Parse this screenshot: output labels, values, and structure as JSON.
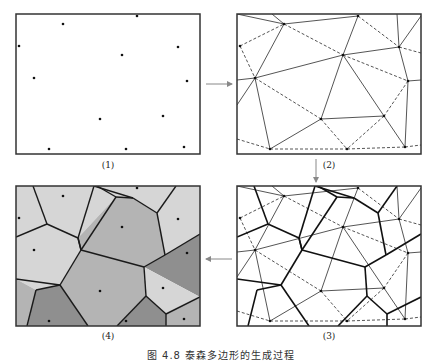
{
  "figure": {
    "caption": "图 4.8   泰森多边形的生成过程",
    "panel_size": [
      184,
      140
    ],
    "colors": {
      "frame": "#333333",
      "line": "#2a2a2a",
      "point": "#111111",
      "arrow": "#888888",
      "cell_light": "#d6d6d6",
      "cell_mid": "#b4b4b4",
      "cell_dark": "#8f8f8f"
    },
    "points": [
      [
        47,
        10
      ],
      [
        121,
        2
      ],
      [
        3,
        32
      ],
      [
        106,
        41
      ],
      [
        162,
        33
      ],
      [
        18,
        64
      ],
      [
        171,
        67
      ],
      [
        84,
        105
      ],
      [
        147,
        102
      ],
      [
        33,
        135
      ],
      [
        110,
        135
      ],
      [
        168,
        133
      ]
    ],
    "delaunay_solid": [
      [
        [
          0,
          0
        ],
        [
          47,
          10
        ]
      ],
      [
        [
          47,
          10
        ],
        [
          121,
          2
        ]
      ],
      [
        [
          47,
          10
        ],
        [
          18,
          64
        ]
      ],
      [
        [
          121,
          2
        ],
        [
          106,
          41
        ]
      ],
      [
        [
          18,
          64
        ],
        [
          106,
          41
        ]
      ],
      [
        [
          106,
          41
        ],
        [
          162,
          33
        ]
      ],
      [
        [
          162,
          33
        ],
        [
          184,
          2
        ]
      ],
      [
        [
          162,
          33
        ],
        [
          160,
          0
        ]
      ],
      [
        [
          162,
          33
        ],
        [
          171,
          67
        ]
      ],
      [
        [
          171,
          67
        ],
        [
          184,
          66
        ]
      ],
      [
        [
          18,
          64
        ],
        [
          0,
          91
        ]
      ],
      [
        [
          18,
          64
        ],
        [
          0,
          66
        ]
      ],
      [
        [
          18,
          64
        ],
        [
          33,
          135
        ]
      ],
      [
        [
          106,
          41
        ],
        [
          84,
          105
        ]
      ],
      [
        [
          106,
          41
        ],
        [
          147,
          102
        ]
      ],
      [
        [
          84,
          105
        ],
        [
          147,
          102
        ]
      ],
      [
        [
          84,
          105
        ],
        [
          33,
          135
        ]
      ],
      [
        [
          147,
          102
        ],
        [
          168,
          133
        ]
      ],
      [
        [
          171,
          67
        ],
        [
          168,
          133
        ]
      ],
      [
        [
          35,
          0
        ],
        [
          47,
          10
        ]
      ]
    ],
    "delaunay_dashed": [
      [
        [
          3,
          32
        ],
        [
          47,
          10
        ]
      ],
      [
        [
          3,
          32
        ],
        [
          18,
          64
        ]
      ],
      [
        [
          47,
          10
        ],
        [
          106,
          41
        ]
      ],
      [
        [
          121,
          2
        ],
        [
          162,
          33
        ]
      ],
      [
        [
          162,
          33
        ],
        [
          184,
          39
        ]
      ],
      [
        [
          106,
          41
        ],
        [
          171,
          67
        ]
      ],
      [
        [
          18,
          64
        ],
        [
          84,
          105
        ]
      ],
      [
        [
          171,
          67
        ],
        [
          147,
          102
        ]
      ],
      [
        [
          84,
          105
        ],
        [
          110,
          135
        ]
      ],
      [
        [
          147,
          102
        ],
        [
          110,
          135
        ]
      ],
      [
        [
          0,
          125
        ],
        [
          33,
          135
        ]
      ],
      [
        [
          33,
          135
        ],
        [
          110,
          135
        ]
      ],
      [
        [
          110,
          135
        ],
        [
          168,
          133
        ]
      ],
      [
        [
          168,
          133
        ],
        [
          184,
          131
        ]
      ]
    ],
    "voronoi_edges": [
      [
        [
          17,
          0
        ],
        [
          31,
          38
        ]
      ],
      [
        [
          31,
          38
        ],
        [
          0,
          51
        ]
      ],
      [
        [
          31,
          38
        ],
        [
          62,
          52
        ]
      ],
      [
        [
          62,
          52
        ],
        [
          78,
          0
        ]
      ],
      [
        [
          62,
          52
        ],
        [
          65,
          64
        ]
      ],
      [
        [
          65,
          64
        ],
        [
          44,
          99
        ]
      ],
      [
        [
          44,
          99
        ],
        [
          0,
          93
        ]
      ],
      [
        [
          44,
          99
        ],
        [
          20,
          104
        ]
      ],
      [
        [
          20,
          104
        ],
        [
          11,
          140
        ]
      ],
      [
        [
          65,
          64
        ],
        [
          128,
          81
        ]
      ],
      [
        [
          128,
          81
        ],
        [
          149,
          69
        ]
      ],
      [
        [
          149,
          69
        ],
        [
          141,
          27
        ]
      ],
      [
        [
          141,
          27
        ],
        [
          117,
          12
        ]
      ],
      [
        [
          117,
          12
        ],
        [
          100,
          11
        ]
      ],
      [
        [
          100,
          11
        ],
        [
          81,
          0
        ]
      ],
      [
        [
          117,
          12
        ],
        [
          78,
          0
        ]
      ],
      [
        [
          141,
          27
        ],
        [
          160,
          0
        ]
      ],
      [
        [
          149,
          69
        ],
        [
          184,
          48
        ]
      ],
      [
        [
          128,
          81
        ],
        [
          130,
          110
        ]
      ],
      [
        [
          130,
          110
        ],
        [
          101,
          140
        ]
      ],
      [
        [
          130,
          110
        ],
        [
          150,
          128
        ]
      ],
      [
        [
          150,
          128
        ],
        [
          184,
          111
        ]
      ],
      [
        [
          150,
          128
        ],
        [
          150,
          140
        ]
      ],
      [
        [
          65,
          64
        ],
        [
          62,
          52
        ]
      ],
      [
        [
          44,
          99
        ],
        [
          72,
          140
        ]
      ],
      [
        [
          100,
          11
        ],
        [
          65,
          64
        ]
      ]
    ],
    "voronoi_cells": [
      {
        "shade": "cell_light",
        "poly": [
          [
            0,
            0
          ],
          [
            17,
            0
          ],
          [
            31,
            38
          ],
          [
            0,
            51
          ]
        ]
      },
      {
        "shade": "cell_light",
        "poly": [
          [
            17,
            0
          ],
          [
            81,
            0
          ],
          [
            100,
            11
          ],
          [
            62,
            52
          ],
          [
            31,
            38
          ]
        ]
      },
      {
        "shade": "cell_light",
        "poly": [
          [
            81,
            0
          ],
          [
            160,
            0
          ],
          [
            141,
            27
          ],
          [
            117,
            12
          ],
          [
            100,
            11
          ]
        ]
      },
      {
        "shade": "cell_light",
        "poly": [
          [
            160,
            0
          ],
          [
            184,
            0
          ],
          [
            184,
            48
          ],
          [
            149,
            69
          ],
          [
            141,
            27
          ]
        ]
      },
      {
        "shade": "cell_mid",
        "poly": [
          [
            100,
            11
          ],
          [
            117,
            12
          ],
          [
            141,
            27
          ],
          [
            149,
            69
          ],
          [
            128,
            81
          ],
          [
            65,
            64
          ],
          [
            62,
            52
          ]
        ]
      },
      {
        "shade": "cell_light",
        "poly": [
          [
            0,
            51
          ],
          [
            31,
            38
          ],
          [
            62,
            52
          ],
          [
            65,
            64
          ],
          [
            44,
            99
          ],
          [
            20,
            104
          ],
          [
            0,
            93
          ]
        ]
      },
      {
        "shade": "cell_dark",
        "poly": [
          [
            149,
            69
          ],
          [
            184,
            48
          ],
          [
            184,
            111
          ],
          [
            128,
            81
          ]
        ]
      },
      {
        "shade": "cell_mid",
        "poly": [
          [
            65,
            64
          ],
          [
            128,
            81
          ],
          [
            130,
            110
          ],
          [
            101,
            140
          ],
          [
            72,
            140
          ],
          [
            44,
            99
          ]
        ]
      },
      {
        "shade": "cell_light",
        "poly": [
          [
            128,
            81
          ],
          [
            184,
            111
          ],
          [
            150,
            128
          ],
          [
            130,
            110
          ]
        ]
      },
      {
        "shade": "cell_mid",
        "poly": [
          [
            0,
            93
          ],
          [
            20,
            104
          ],
          [
            11,
            140
          ],
          [
            0,
            140
          ]
        ]
      },
      {
        "shade": "cell_dark",
        "poly": [
          [
            20,
            104
          ],
          [
            44,
            99
          ],
          [
            72,
            140
          ],
          [
            11,
            140
          ]
        ]
      },
      {
        "shade": "cell_dark",
        "poly": [
          [
            130,
            110
          ],
          [
            150,
            128
          ],
          [
            150,
            140
          ],
          [
            101,
            140
          ]
        ]
      },
      {
        "shade": "cell_mid",
        "poly": [
          [
            150,
            128
          ],
          [
            184,
            111
          ],
          [
            184,
            140
          ],
          [
            150,
            140
          ]
        ]
      }
    ],
    "panels": [
      {
        "id": "1",
        "label": "(1)",
        "origin": [
          16,
          14
        ],
        "show": [
          "points"
        ]
      },
      {
        "id": "2",
        "label": "(2)",
        "origin": [
          237,
          14
        ],
        "show": [
          "points",
          "delaunay"
        ]
      },
      {
        "id": "3",
        "label": "(3)",
        "origin": [
          237,
          186
        ],
        "show": [
          "points",
          "delaunay",
          "voronoi"
        ]
      },
      {
        "id": "4",
        "label": "(4)",
        "origin": [
          16,
          186
        ],
        "show": [
          "points",
          "cells"
        ]
      }
    ],
    "arrows": [
      {
        "from": [
          206,
          84
        ],
        "to": [
          232,
          84
        ]
      },
      {
        "from": [
          316,
          159
        ],
        "to": [
          316,
          182
        ]
      },
      {
        "from": [
          232,
          259
        ],
        "to": [
          206,
          259
        ]
      }
    ]
  }
}
